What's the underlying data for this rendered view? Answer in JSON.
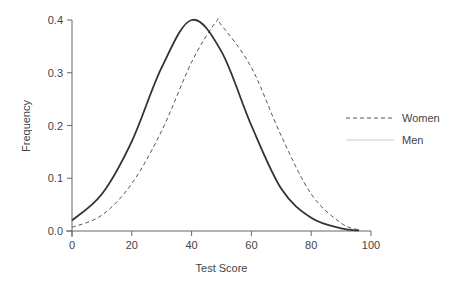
{
  "chart_data": {
    "type": "line",
    "title": "",
    "xlabel": "Test Score",
    "ylabel": "Frequency",
    "xlim": [
      0,
      100
    ],
    "ylim": [
      0,
      0.4
    ],
    "x_ticks": [
      0,
      20,
      40,
      60,
      80,
      100
    ],
    "y_ticks": [
      "0.0",
      "0.1",
      "0.2",
      "0.3",
      "0.4"
    ],
    "grid": false,
    "legend_position": "right",
    "series": [
      {
        "name": "Women",
        "style": "dashed",
        "color": "#555555",
        "x": [
          0,
          10,
          20,
          30,
          40,
          48,
          50,
          60,
          70,
          80,
          90,
          96
        ],
        "y": [
          0.007,
          0.03,
          0.09,
          0.19,
          0.32,
          0.395,
          0.39,
          0.31,
          0.18,
          0.07,
          0.015,
          0.002
        ]
      },
      {
        "name": "Men",
        "style": "solid",
        "color": "#333333",
        "x": [
          0,
          10,
          20,
          30,
          40,
          50,
          60,
          70,
          80,
          90,
          96
        ],
        "y": [
          0.02,
          0.07,
          0.17,
          0.31,
          0.4,
          0.34,
          0.2,
          0.08,
          0.025,
          0.005,
          0.001
        ]
      }
    ]
  },
  "labels": {
    "xlabel": "Test Score",
    "ylabel": "Frequency",
    "legend_women": "Women",
    "legend_men": "Men"
  }
}
